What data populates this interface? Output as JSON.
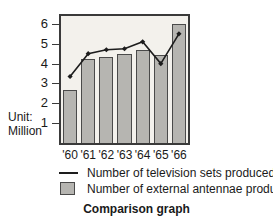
{
  "chart_data": {
    "type": "bar",
    "title": "Comparison graph",
    "xlabel": "",
    "ylabel": "Unit: Million",
    "categories": [
      "'60",
      "'61",
      "'62",
      "'63",
      "'64",
      "'65",
      "'66"
    ],
    "ylim": [
      0,
      6.4
    ],
    "yticks": [
      1,
      2,
      3,
      4,
      5,
      6
    ],
    "ytick_labels": [
      "1",
      "2",
      "3",
      "4",
      "5",
      "6"
    ],
    "grid": false,
    "legend_position": "below",
    "series": [
      {
        "name": "Number of television sets produced",
        "type": "line",
        "marker": "diamond",
        "color": "#1d1d1d",
        "values": [
          3.35,
          4.5,
          4.7,
          4.75,
          5.1,
          4.0,
          5.5
        ]
      },
      {
        "name": "Number of external antennae produced",
        "type": "bar",
        "color": "#b6b5b1",
        "values": [
          2.67,
          4.25,
          4.35,
          4.47,
          4.68,
          4.45,
          6.0
        ]
      }
    ]
  },
  "axis": {
    "unit_line1": "Unit:",
    "unit_line2": "Million"
  },
  "legend": {
    "items": [
      {
        "key": "line-dash",
        "label": "Number of television sets produced"
      },
      {
        "key": "gray-swatch",
        "label": "Number of external antennae produced"
      }
    ]
  },
  "caption": {
    "text": "Comparison graph"
  },
  "colors": {
    "bar_fill": "#b6b5b1",
    "bar_stroke": "#4a4a4a",
    "line": "#1d1d1d",
    "plot_background": "#f3f1ec",
    "plot_border": "#3a3a3a",
    "text": "#1a1a1a"
  }
}
